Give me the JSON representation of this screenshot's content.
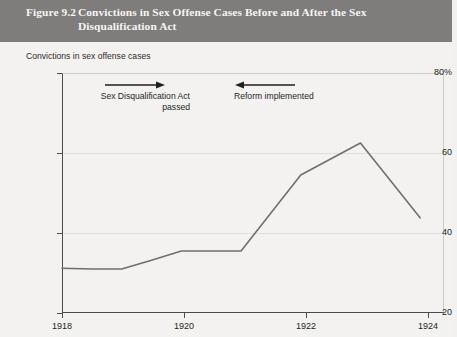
{
  "header": {
    "figure_number": "Figure 9.2",
    "title_line_1": "Convictions in Sex Offense Cases Before and After the Sex",
    "title_line_2": "Disqualification Act",
    "background_color": "#7e7d7b",
    "text_color": "#f6f5f3"
  },
  "annotations": {
    "left": {
      "line_1": "Sex Disqualification Act",
      "line_2": "passed",
      "arrow": "arrow-right",
      "arrow_direction": "right"
    },
    "right": {
      "line_1": "Reform implemented",
      "arrow": "arrow-left",
      "arrow_direction": "left"
    }
  },
  "chart_data": {
    "type": "line",
    "title": "Convictions in Sex Offense Cases Before and After the Sex Disqualification Act",
    "subtitle": "",
    "ylabel": "Convictions in sex offense cases",
    "xlabel": "",
    "x": [
      1918,
      1918.5,
      1919,
      1919.5,
      1920,
      1920.5,
      1921,
      1922,
      1923,
      1924
    ],
    "values": [
      31.2,
      31.0,
      31.0,
      33.2,
      35.5,
      35.5,
      35.5,
      54.5,
      62.5,
      43.8
    ],
    "series": [
      {
        "name": "Convictions in sex offense cases",
        "values": [
          31.2,
          31.0,
          31.0,
          33.2,
          35.5,
          35.5,
          35.5,
          54.5,
          62.5,
          43.8
        ],
        "color": "#6f6f6d"
      }
    ],
    "xlim": [
      1918,
      1924.4
    ],
    "ylim": [
      20,
      80
    ],
    "xticks": [
      1918,
      1920,
      1922,
      1924
    ],
    "xtick_labels": [
      "1918",
      "1920",
      "1922",
      "1924"
    ],
    "yticks": [
      20,
      40,
      60,
      80
    ],
    "ytick_labels": [
      "20",
      "40",
      "60",
      "80%"
    ],
    "grid": true,
    "legend": "none",
    "line_color": "#6f6f6d",
    "axis_color": "#4a4a48",
    "grid_color": "#dededc",
    "background_color": "#f3f2f0"
  }
}
